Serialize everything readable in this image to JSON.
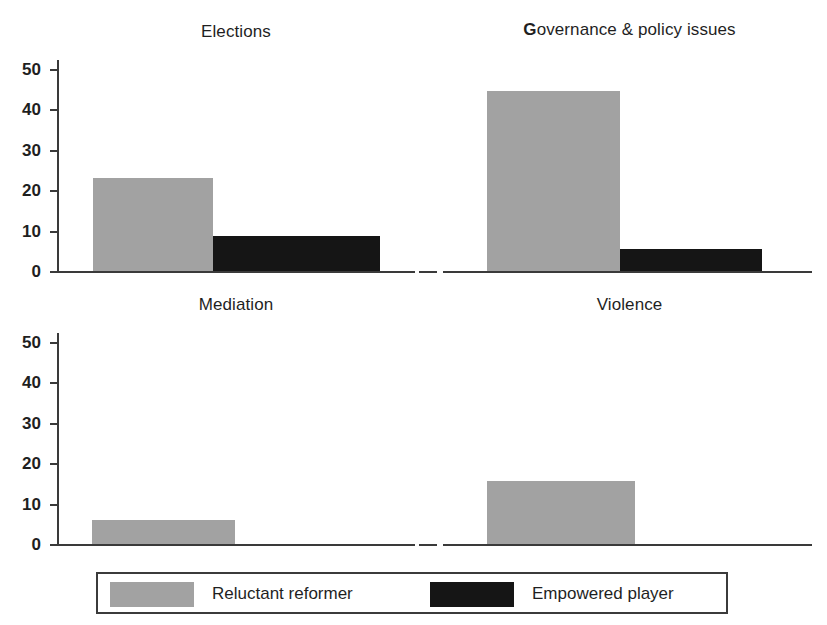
{
  "chart_data": {
    "type": "bar",
    "title": "",
    "layout": "2x2 small-multiples (faceted bar panels)",
    "categories": [
      "Reluctant reformer",
      "Empowered player"
    ],
    "series_colors": {
      "reluctant_reformer": "#a2a2a2",
      "empowered_player": "#151515"
    },
    "ylim": [
      0,
      50
    ],
    "yticks": [
      0,
      10,
      20,
      30,
      40,
      50
    ],
    "ytick_labels": [
      "0",
      "10",
      "20",
      "30",
      "40",
      "50"
    ],
    "xlabel": "",
    "ylabel": "",
    "grid": false,
    "legend_position": "bottom",
    "panels": [
      {
        "id": "elections",
        "title": "Elections",
        "title_lead_bold": "",
        "title_rest": "Elections",
        "values": {
          "reluctant_reformer": 23,
          "empowered_player": 8.6
        },
        "bars": [
          {
            "name": "Reluctant reformer",
            "value": 23,
            "color": "#a2a2a2"
          },
          {
            "name": "Empowered player",
            "value": 8.6,
            "color": "#151515"
          }
        ]
      },
      {
        "id": "governance-policy-issues",
        "title": "Governance & policy issues",
        "title_lead_bold": "G",
        "title_rest": "overnance & policy issues",
        "values": {
          "reluctant_reformer": 44.5,
          "empowered_player": 5.5
        },
        "bars": [
          {
            "name": "Reluctant reformer",
            "value": 44.5,
            "color": "#a2a2a2"
          },
          {
            "name": "Empowered player",
            "value": 5.5,
            "color": "#151515"
          }
        ]
      },
      {
        "id": "mediation",
        "title": "Mediation",
        "title_lead_bold": "",
        "title_rest": "Mediation",
        "values": {
          "reluctant_reformer": 6,
          "empowered_player": 0
        },
        "bars": [
          {
            "name": "Reluctant reformer",
            "value": 6,
            "color": "#a2a2a2"
          },
          {
            "name": "Empowered player",
            "value": 0,
            "color": "#151515"
          }
        ]
      },
      {
        "id": "violence",
        "title": "Violence",
        "title_lead_bold": "",
        "title_rest": "Violence",
        "values": {
          "reluctant_reformer": 15.5,
          "empowered_player": 0
        },
        "bars": [
          {
            "name": "Reluctant reformer",
            "value": 15.5,
            "color": "#a2a2a2"
          },
          {
            "name": "Empowered player",
            "value": 0,
            "color": "#151515"
          }
        ]
      }
    ],
    "legend": [
      {
        "label": "Reluctant reformer",
        "color": "#a2a2a2"
      },
      {
        "label": "Empowered player",
        "color": "#151515"
      }
    ]
  }
}
